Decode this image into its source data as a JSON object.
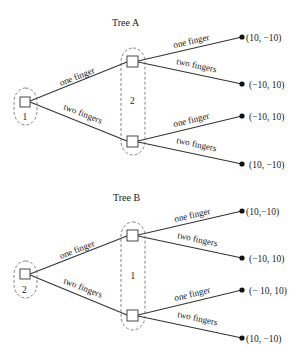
{
  "trees": [
    {
      "title": "Tree A",
      "root_player": "1",
      "second_player": "2",
      "root_actions": [
        "one finger",
        "two fingers"
      ],
      "second_actions_top": [
        "one finger",
        "two fingers"
      ],
      "second_actions_bottom": [
        "one finger",
        "two fingers"
      ],
      "payoffs": [
        "(10, −10)",
        "(−10, 10)",
        "(−10, 10)",
        "(10, −10)"
      ]
    },
    {
      "title": "Tree B",
      "root_player": "2",
      "second_player": "1",
      "root_actions": [
        "one finger",
        "two fingers"
      ],
      "second_actions_top": [
        "one finger",
        "two fingers"
      ],
      "second_actions_bottom": [
        "one finger",
        "two fingers"
      ],
      "payoffs": [
        "(10,−10)",
        "(−10, 10)",
        "(− 10, 10)",
        "(10, −10)"
      ]
    }
  ]
}
